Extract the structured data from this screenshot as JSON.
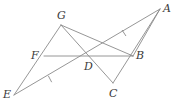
{
  "figure": {
    "type": "geometry-diagram",
    "background_color": "#ffffff",
    "line_color": "#8a8a8a",
    "label_color": "#3a3a3a",
    "width": 179,
    "height": 107,
    "labels": {
      "A": "A",
      "B": "B",
      "C": "C",
      "D": "D",
      "E": "E",
      "F": "F",
      "G": "G"
    },
    "points": [
      {
        "name": "A",
        "x": 160,
        "y": 9,
        "label_x": 163,
        "label_y": 3
      },
      {
        "name": "B",
        "x": 133,
        "y": 56,
        "label_x": 136,
        "label_y": 50
      },
      {
        "name": "C",
        "x": 113,
        "y": 83,
        "label_x": 109,
        "label_y": 88
      },
      {
        "name": "D",
        "x": 88,
        "y": 56,
        "label_x": 84,
        "label_y": 61
      },
      {
        "name": "E",
        "x": 14,
        "y": 95,
        "label_x": 3,
        "label_y": 89
      },
      {
        "name": "F",
        "x": 44,
        "y": 56,
        "label_x": 31,
        "label_y": 50
      },
      {
        "name": "G",
        "x": 61,
        "y": 25,
        "label_x": 57,
        "label_y": 10
      }
    ],
    "segments": [
      {
        "name": "segment-EG",
        "from": "E",
        "to": "G"
      },
      {
        "name": "segment-EA",
        "from": "E",
        "to": "A"
      },
      {
        "name": "segment-GB",
        "from": "G",
        "to": "B"
      },
      {
        "name": "segment-GC",
        "from": "G",
        "to": "C"
      },
      {
        "name": "segment-FB",
        "from": "F",
        "to": "B"
      },
      {
        "name": "segment-AC",
        "from": "A",
        "to": "C"
      },
      {
        "name": "segment-AB",
        "from": "A",
        "to": "B"
      }
    ],
    "tick_marks": [
      {
        "name": "tick-mark-ED",
        "on_segment": "ED",
        "x": 50,
        "y": 79,
        "count": 1
      },
      {
        "name": "tick-mark-DA",
        "on_segment": "DA",
        "x": 124,
        "y": 33,
        "count": 1
      }
    ]
  }
}
